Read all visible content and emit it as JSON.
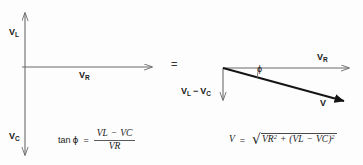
{
  "figure": {
    "background_color": "#fdfdfd",
    "line_color": "#6b6b6b",
    "bold_line_color": "#1a1a1a",
    "text_color": "#1a1a1a"
  },
  "left_diagram": {
    "name": "component-phasor-axes",
    "vertical_up_label": "V",
    "vertical_up_sub": "L",
    "vertical_down_label": "V",
    "vertical_down_sub": "C",
    "horizontal_label": "V",
    "horizontal_sub": "R",
    "axis": {
      "origin_x": 25,
      "origin_y": 67,
      "top_y": 10,
      "bottom_y": 158,
      "right_x": 155
    }
  },
  "equals_sign": "=",
  "right_diagram": {
    "name": "resultant-phasor-triangle",
    "horizontal_label": "V",
    "horizontal_sub": "R",
    "vertical_label_first": "V",
    "vertical_sub_first": "L",
    "vertical_operator": "−",
    "vertical_label_second": "V",
    "vertical_sub_second": "C",
    "resultant_label": "V",
    "angle_label": "ϕ",
    "geometry": {
      "vertex_x": 223,
      "vertex_y": 68,
      "horizontal_tip_x": 352,
      "vertical_tip_y": 103,
      "resultant_tip_x": 352,
      "resultant_tip_y": 103
    }
  },
  "formula_left": {
    "function": "tan",
    "angle": "ϕ",
    "equals": "=",
    "numerator_first": "V",
    "numerator_first_sub": "L",
    "numerator_operator": "−",
    "numerator_second": "V",
    "numerator_second_sub": "C",
    "denominator": "V",
    "denominator_sub": "R",
    "plain_text": "tan ϕ = (V_L − V_C) / V_R"
  },
  "formula_right": {
    "lhs": "V",
    "equals": "=",
    "radical": "√",
    "term1": "V",
    "term1_sub": "R",
    "term1_exp": "2",
    "operator": "+",
    "open_paren": "(",
    "term2": "V",
    "term2_sub": "L",
    "term2_operator": "−",
    "term3": "V",
    "term3_sub": "C",
    "close_paren": ")",
    "term_group_exp": "2",
    "plain_text": "V = √(V_R² + (V_L − V_C)²)"
  }
}
